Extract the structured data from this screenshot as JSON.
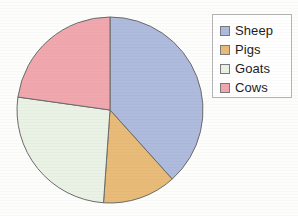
{
  "chart_data": {
    "type": "pie",
    "title": "",
    "categories": [
      "Sheep",
      "Pigs",
      "Goats",
      "Cows"
    ],
    "values": [
      38.3,
      12.8,
      26.1,
      22.8
    ],
    "unit": "percent",
    "angles_deg": [
      138,
      46,
      94,
      82
    ],
    "start_angle_deg": 0,
    "direction": "clockwise",
    "colors": [
      "#aebbdd",
      "#e8bc78",
      "#eaf2e6",
      "#f0a8ae"
    ],
    "slice_edge_color": "#6b6b6b",
    "legend": {
      "position": "right",
      "border_color": "#b4b4b4",
      "background": "#ffffff",
      "entries": [
        {
          "label": "Sheep",
          "color": "#aebbdd"
        },
        {
          "label": "Pigs",
          "color": "#e8bc78"
        },
        {
          "label": "Goats",
          "color": "#eaf2e6"
        },
        {
          "label": "Cows",
          "color": "#f0a8ae"
        }
      ]
    },
    "geometry": {
      "center_x": 110,
      "center_y": 110,
      "radius": 93
    },
    "grid": false,
    "xlabel": "",
    "ylabel": ""
  },
  "figure": {
    "background": "#fdfdfc"
  }
}
